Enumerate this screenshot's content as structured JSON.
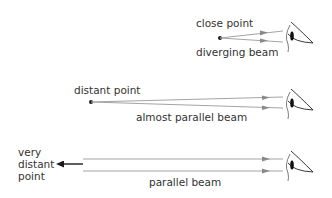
{
  "diagram": {
    "type": "optics-beams-to-eye",
    "colors": {
      "ray": "#9a9a9a",
      "arrowhead": "#8a8a8a",
      "point": "#1a1a1a",
      "text": "#333333",
      "eye": "#222222"
    },
    "rows": [
      {
        "id": "close",
        "point_label": "close point",
        "beam_label": "diverging beam"
      },
      {
        "id": "distant",
        "point_label": "distant point",
        "beam_label": "almost parallel beam"
      },
      {
        "id": "very-distant",
        "point_label_lines": [
          "very",
          "distant",
          "point"
        ],
        "beam_label": "parallel beam"
      }
    ]
  }
}
